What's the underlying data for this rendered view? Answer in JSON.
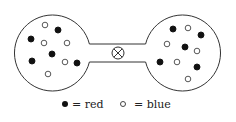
{
  "diagram": {
    "left_vessel": {
      "center": [
        52,
        50
      ],
      "radius": 38,
      "particles": [
        {
          "type": "blue",
          "x": 45,
          "y": 25
        },
        {
          "type": "red",
          "x": 58,
          "y": 30
        },
        {
          "type": "red",
          "x": 31,
          "y": 39
        },
        {
          "type": "blue",
          "x": 44,
          "y": 43
        },
        {
          "type": "blue",
          "x": 67,
          "y": 43
        },
        {
          "type": "red",
          "x": 52,
          "y": 54
        },
        {
          "type": "red",
          "x": 32,
          "y": 61
        },
        {
          "type": "blue",
          "x": 65,
          "y": 62
        },
        {
          "type": "red",
          "x": 77,
          "y": 63
        },
        {
          "type": "blue",
          "x": 48,
          "y": 74
        }
      ]
    },
    "right_vessel": {
      "center": [
        183,
        50
      ],
      "radius": 38,
      "particles": [
        {
          "type": "red",
          "x": 173,
          "y": 29
        },
        {
          "type": "blue",
          "x": 188,
          "y": 28
        },
        {
          "type": "red",
          "x": 201,
          "y": 35
        },
        {
          "type": "blue",
          "x": 167,
          "y": 44
        },
        {
          "type": "red",
          "x": 185,
          "y": 47
        },
        {
          "type": "blue",
          "x": 197,
          "y": 51
        },
        {
          "type": "red",
          "x": 160,
          "y": 62
        },
        {
          "type": "blue",
          "x": 177,
          "y": 62
        },
        {
          "type": "red",
          "x": 197,
          "y": 67
        },
        {
          "type": "blue",
          "x": 188,
          "y": 79
        }
      ]
    },
    "valve": {
      "icon": "closed-valve-icon",
      "x": 118,
      "y": 53,
      "radius": 6
    }
  },
  "legend": {
    "red_label": "= red",
    "blue_label": "= blue"
  },
  "colors": {
    "stroke": "#333333",
    "red_fill": "#111111",
    "blue_fill": "#ffffff"
  }
}
